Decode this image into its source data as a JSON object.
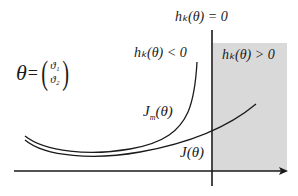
{
  "diagram": {
    "theta_definition": {
      "lhs": "θ",
      "equals": "=",
      "vector": [
        "ϑ₁",
        "ϑ₂"
      ]
    },
    "labels": {
      "boundary": "hₖ(θ) = 0",
      "infeasible_left": "hₖ(θ) < 0",
      "feasible_right": "hₖ(θ) > 0",
      "model_cost": "J",
      "model_cost_sub": "m",
      "model_cost_arg": "(θ)",
      "true_cost": "J(θ)"
    },
    "colors": {
      "shade": "#d9d9d9",
      "line": "#1a1a1a",
      "background": "#ffffff"
    },
    "geometry": {
      "boundary_x": 212,
      "axis_y": 171,
      "shaded_region": {
        "x": 213,
        "y": 43,
        "width": 74,
        "height": 128
      }
    }
  }
}
